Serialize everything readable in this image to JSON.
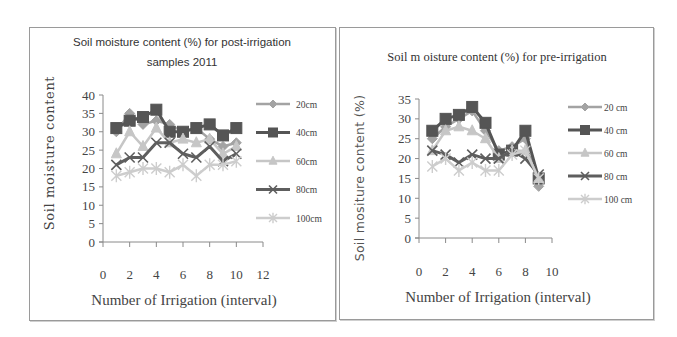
{
  "chart_data": [
    {
      "type": "line",
      "title": "Soil moisture content (%) for post-irrigation samples 2011",
      "title_lines": [
        "Soil moisture  content (%) for post-irrigation",
        "samples 2011"
      ],
      "xlabel": "Number of Irrigation (interval)",
      "ylabel": "Soil moisture content",
      "x": [
        1,
        2,
        3,
        4,
        5,
        6,
        7,
        8,
        9,
        10
      ],
      "xlim": [
        0,
        12
      ],
      "ylim": [
        0,
        40
      ],
      "xticks": [
        0,
        2,
        4,
        6,
        8,
        10,
        12
      ],
      "yticks": [
        0,
        5,
        10,
        15,
        20,
        25,
        30,
        35,
        40
      ],
      "grid": false,
      "legend_position": "right",
      "series": [
        {
          "name": "20cm",
          "color": "#a3a3a3",
          "marker": "diamond",
          "width": 2.5,
          "values": [
            30,
            35,
            32,
            33,
            32,
            30,
            31,
            28,
            26,
            27
          ]
        },
        {
          "name": "40cm",
          "color": "#555555",
          "marker": "square",
          "width": 3,
          "values": [
            31,
            33,
            34,
            36,
            30,
            30,
            31,
            32,
            29,
            31
          ]
        },
        {
          "name": "60cm",
          "color": "#c6c6c6",
          "marker": "triangle",
          "width": 2.5,
          "values": [
            24,
            30,
            26,
            31,
            27,
            28,
            27,
            28,
            24,
            26
          ]
        },
        {
          "name": "80cm",
          "color": "#5e5e5e",
          "marker": "x",
          "width": 3,
          "values": [
            21,
            23,
            23,
            27,
            27,
            24,
            23,
            26,
            22,
            24
          ]
        },
        {
          "name": "100cm",
          "color": "#cdcdcd",
          "marker": "star",
          "width": 2.5,
          "values": [
            18,
            19,
            20,
            20,
            19,
            21,
            18,
            21,
            21,
            22
          ]
        }
      ]
    },
    {
      "type": "line",
      "title": "Soil m oisture content (%) for pre-irrigation",
      "title_lines": [
        "Soil m oisture content (%) for pre-irrigation"
      ],
      "xlabel": "Number of Irrigation (interval)",
      "ylabel": "Soil mositure content (%)",
      "x": [
        1,
        2,
        3,
        4,
        5,
        6,
        7,
        8,
        9
      ],
      "xlim": [
        0,
        10
      ],
      "ylim": [
        0,
        35
      ],
      "xticks": [
        0,
        2,
        4,
        6,
        8,
        10
      ],
      "yticks": [
        0,
        5,
        10,
        15,
        20,
        25,
        30,
        35
      ],
      "grid": false,
      "legend_position": "right",
      "series": [
        {
          "name": "20 cm",
          "color": "#a3a3a3",
          "marker": "diamond",
          "width": 2.5,
          "values": [
            25,
            28,
            30,
            32,
            27,
            22,
            23,
            25,
            13
          ]
        },
        {
          "name": "40 cm",
          "color": "#555555",
          "marker": "square",
          "width": 3,
          "values": [
            27,
            30,
            31,
            33,
            29,
            21,
            22,
            27,
            15
          ]
        },
        {
          "name": "60 cm",
          "color": "#c6c6c6",
          "marker": "triangle",
          "width": 2.5,
          "values": [
            22,
            27,
            28,
            27,
            25,
            20,
            22,
            22,
            15
          ]
        },
        {
          "name": "80 cm",
          "color": "#5e5e5e",
          "marker": "x",
          "width": 3,
          "values": [
            22,
            21,
            19,
            21,
            20,
            20,
            22,
            20,
            16
          ]
        },
        {
          "name": "100 cm",
          "color": "#cdcdcd",
          "marker": "star",
          "width": 2.5,
          "values": [
            18,
            20,
            17,
            19,
            17,
            17,
            21,
            22,
            15
          ]
        }
      ]
    }
  ],
  "layout": {
    "panels": [
      {
        "plot": {
          "x0": 73,
          "y0": 214,
          "w": 160,
          "h": 147
        },
        "title_y": [
          18,
          38
        ],
        "title_x": 152,
        "ylabel_x": 24,
        "ylabel_cy": 125,
        "xlabel_y": 277,
        "xlabel_x": 154,
        "xtick_y": 251,
        "legend_x": 226,
        "legend_y0": 76,
        "legend_dy": 28.5,
        "legend_text_dx": 40
      },
      {
        "plot": {
          "x0": 79,
          "y0": 210,
          "w": 133,
          "h": 139
        },
        "title_y": [
          33
        ],
        "title_x": 157,
        "ylabel_x": 24,
        "ylabel_cy": 150,
        "xlabel_y": 274,
        "xlabel_x": 158,
        "xtick_y": 248,
        "legend_x": 228,
        "legend_y0": 79,
        "legend_dy": 23,
        "legend_text_dx": 36
      }
    ]
  }
}
